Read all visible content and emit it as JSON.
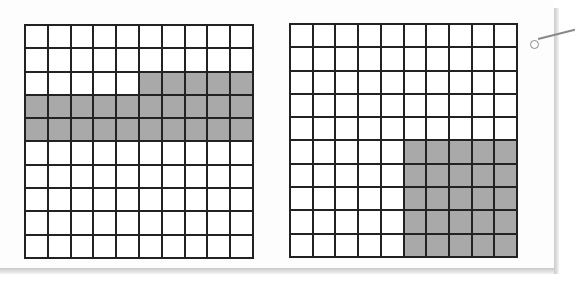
{
  "figure": {
    "colors": {
      "shaded": "#a9a9a9",
      "unshaded": "#ffffff",
      "lines": "#222222"
    },
    "grids": [
      {
        "id": "left",
        "rows": 10,
        "cols": 10,
        "shaded_count": 25,
        "shaded_cells": [
          [
            2,
            5
          ],
          [
            2,
            6
          ],
          [
            2,
            7
          ],
          [
            2,
            8
          ],
          [
            2,
            9
          ],
          [
            3,
            0
          ],
          [
            3,
            1
          ],
          [
            3,
            2
          ],
          [
            3,
            3
          ],
          [
            3,
            4
          ],
          [
            3,
            5
          ],
          [
            3,
            6
          ],
          [
            3,
            7
          ],
          [
            3,
            8
          ],
          [
            3,
            9
          ],
          [
            4,
            0
          ],
          [
            4,
            1
          ],
          [
            4,
            2
          ],
          [
            4,
            3
          ],
          [
            4,
            4
          ],
          [
            4,
            5
          ],
          [
            4,
            6
          ],
          [
            4,
            7
          ],
          [
            4,
            8
          ],
          [
            4,
            9
          ]
        ]
      },
      {
        "id": "right",
        "rows": 10,
        "cols": 10,
        "shaded_count": 25,
        "shaded_cells": [
          [
            5,
            5
          ],
          [
            5,
            6
          ],
          [
            5,
            7
          ],
          [
            5,
            8
          ],
          [
            5,
            9
          ],
          [
            6,
            5
          ],
          [
            6,
            6
          ],
          [
            6,
            7
          ],
          [
            6,
            8
          ],
          [
            6,
            9
          ],
          [
            7,
            5
          ],
          [
            7,
            6
          ],
          [
            7,
            7
          ],
          [
            7,
            8
          ],
          [
            7,
            9
          ],
          [
            8,
            5
          ],
          [
            8,
            6
          ],
          [
            8,
            7
          ],
          [
            8,
            8
          ],
          [
            8,
            9
          ],
          [
            9,
            5
          ],
          [
            9,
            6
          ],
          [
            9,
            7
          ],
          [
            9,
            8
          ],
          [
            9,
            9
          ]
        ]
      }
    ],
    "pin_icon": "circle-pin-with-line"
  }
}
